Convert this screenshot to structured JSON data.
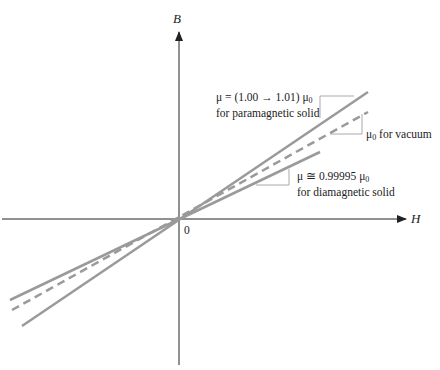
{
  "diagram": {
    "axes": {
      "x_label": "H",
      "y_label": "B",
      "origin_label": "0"
    },
    "lines": [
      {
        "id": "paramagnetic",
        "style": "solid",
        "color": "#9a9a9a",
        "label_line1_prefix": "μ = (1.00 → 1.01) μ",
        "label_line1_sub": "0",
        "label_line2": "for paramagnetic solid"
      },
      {
        "id": "vacuum",
        "style": "dashed",
        "color": "#9a9a9a",
        "label_prefix": "μ",
        "label_sub": "0",
        "label_suffix": " for vacuum"
      },
      {
        "id": "diamagnetic",
        "style": "solid",
        "color": "#9a9a9a",
        "label_line1_prefix": "μ ≅ 0.99995 μ",
        "label_line1_sub": "0",
        "label_line2": "for diamagnetic solid"
      }
    ]
  }
}
